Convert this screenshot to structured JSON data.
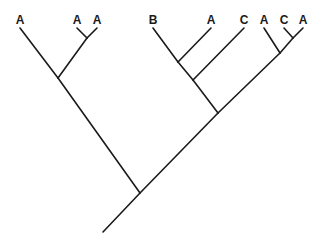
{
  "diagram": {
    "type": "cladogram",
    "line_color": "#1a1a1a",
    "background": "#ffffff",
    "leaves": [
      {
        "id": "L1",
        "label": "A",
        "x": 20,
        "y": 28
      },
      {
        "id": "L2",
        "label": "A",
        "x": 77,
        "y": 28
      },
      {
        "id": "L3",
        "label": "A",
        "x": 97,
        "y": 28
      },
      {
        "id": "L4",
        "label": "B",
        "x": 153,
        "y": 28
      },
      {
        "id": "L5",
        "label": "A",
        "x": 211,
        "y": 28
      },
      {
        "id": "L6",
        "label": "C",
        "x": 244,
        "y": 28
      },
      {
        "id": "L7",
        "label": "A",
        "x": 264,
        "y": 28
      },
      {
        "id": "L8",
        "label": "C",
        "x": 284,
        "y": 28
      },
      {
        "id": "L9",
        "label": "A",
        "x": 303,
        "y": 28
      }
    ],
    "internal_nodes": [
      {
        "id": "N_AA",
        "x": 87,
        "y": 38,
        "children": [
          "L2",
          "L3"
        ]
      },
      {
        "id": "N_left",
        "x": 58,
        "y": 78,
        "children": [
          "L1",
          "N_AA"
        ]
      },
      {
        "id": "N_BA",
        "x": 178,
        "y": 62,
        "children": [
          "L4",
          "L5"
        ]
      },
      {
        "id": "N_BAC",
        "x": 193,
        "y": 80,
        "children": [
          "N_BA",
          "L6"
        ]
      },
      {
        "id": "N_CA",
        "x": 293,
        "y": 38,
        "children": [
          "L8",
          "L9"
        ]
      },
      {
        "id": "N_ACA",
        "x": 280,
        "y": 53,
        "children": [
          "L7",
          "N_CA"
        ]
      },
      {
        "id": "N_right",
        "x": 218,
        "y": 113,
        "children": [
          "N_BAC",
          "N_ACA"
        ]
      },
      {
        "id": "N_root",
        "x": 140,
        "y": 193,
        "children": [
          "N_left",
          "N_right"
        ]
      }
    ],
    "root_stem": {
      "from": {
        "x": 103,
        "y": 232
      },
      "to": "N_root"
    },
    "leaf_order": [
      "A",
      "A",
      "A",
      "B",
      "A",
      "C",
      "A",
      "C",
      "A"
    ]
  }
}
